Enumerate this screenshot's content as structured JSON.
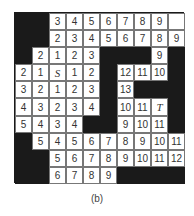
{
  "figure": {
    "caption": "(b)",
    "legend": {
      "wall": "#",
      "empty": "",
      "start": "S",
      "target": "T"
    },
    "colors": {
      "wall": "#1a1a1a",
      "open": "#ffffff",
      "text": "#333333"
    },
    "grid": [
      [
        "#",
        "#",
        "3",
        "4",
        "5",
        "6",
        "7",
        "8",
        "9",
        ""
      ],
      [
        "#",
        "#",
        "2",
        "3",
        "4",
        "5",
        "6",
        "7",
        "8",
        "9"
      ],
      [
        "#",
        "2",
        "1",
        "2",
        "3",
        "#",
        "#",
        "#",
        "9",
        "#"
      ],
      [
        "2",
        "1",
        "S",
        "1",
        "2",
        "#",
        "12",
        "11",
        "10",
        "#"
      ],
      [
        "3",
        "2",
        "1",
        "2",
        "3",
        "#",
        "13",
        "#",
        "#",
        "#"
      ],
      [
        "4",
        "3",
        "2",
        "3",
        "4",
        "#",
        "10",
        "11",
        "T",
        "#"
      ],
      [
        "5",
        "4",
        "3",
        "4",
        "#",
        "#",
        "9",
        "10",
        "11",
        "#"
      ],
      [
        "#",
        "5",
        "4",
        "5",
        "6",
        "7",
        "8",
        "9",
        "10",
        "11"
      ],
      [
        "#",
        "#",
        "5",
        "6",
        "7",
        "8",
        "9",
        "10",
        "11",
        "12"
      ],
      [
        "#",
        "#",
        "6",
        "7",
        "8",
        "9",
        "#",
        "#",
        "#",
        "#"
      ]
    ]
  }
}
